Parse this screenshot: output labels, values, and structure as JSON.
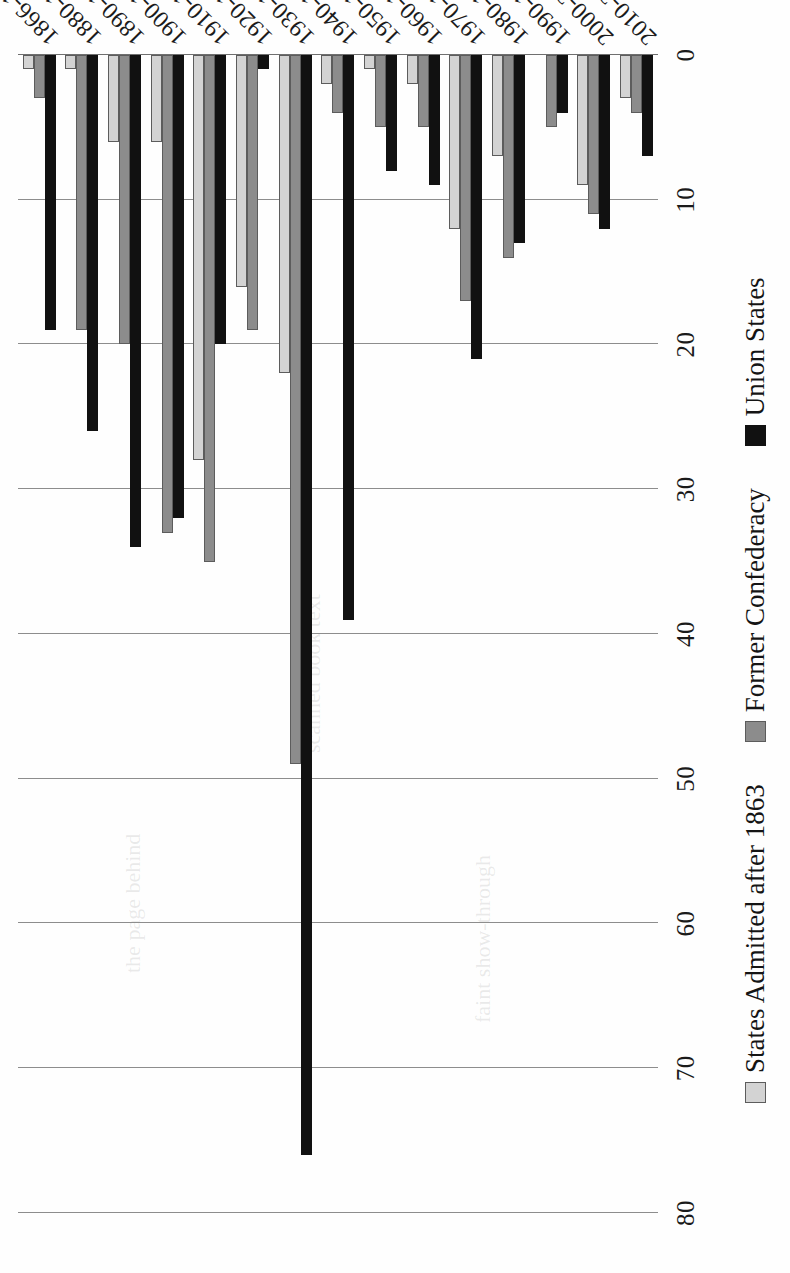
{
  "chart_data": {
    "type": "bar",
    "orientation": "horizontal-rotated",
    "title": "",
    "xlabel": "",
    "ylabel": "",
    "grid": true,
    "legend_position": "bottom",
    "value_axis_ticks": [
      "0",
      "10",
      "20",
      "30",
      "40",
      "50",
      "60",
      "70",
      "80"
    ],
    "value_axis_range": [
      0,
      80
    ],
    "categories": [
      "1866-1879",
      "1880-1889",
      "1890-1899",
      "1900-1909",
      "1910-1919",
      "1920-1929",
      "1930-1939",
      "1940-1949",
      "1950-1959",
      "1960-1969",
      "1970-1979",
      "1980-1989",
      "1990-1999",
      "2000-2009",
      "2010-2019"
    ],
    "series": [
      {
        "name": "States Admitted after 1863",
        "color": "#d3d3d3",
        "values": [
          1,
          1,
          6,
          6,
          28,
          16,
          22,
          2,
          1,
          2,
          12,
          7,
          0,
          9,
          3
        ]
      },
      {
        "name": "Former Confederacy",
        "color": "#8c8c8c",
        "values": [
          3,
          19,
          20,
          33,
          35,
          19,
          49,
          4,
          5,
          5,
          17,
          14,
          5,
          11,
          4
        ]
      },
      {
        "name": "Union States",
        "color": "#111111",
        "values": [
          19,
          26,
          34,
          32,
          20,
          1,
          76,
          39,
          8,
          9,
          21,
          13,
          4,
          12,
          7
        ]
      }
    ]
  },
  "legend": {
    "items": [
      {
        "label": "States Admitted after 1863",
        "swatch": "light-gray-swatch"
      },
      {
        "label": "Former Confederacy",
        "swatch": "dark-gray-swatch"
      },
      {
        "label": "Union States",
        "swatch": "black-swatch"
      }
    ]
  }
}
